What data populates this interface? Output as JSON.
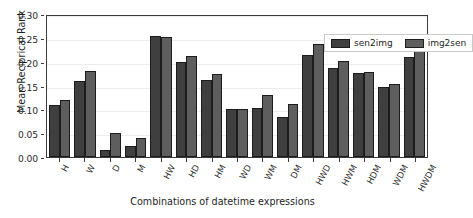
{
  "chart_data": {
    "type": "bar",
    "title": "",
    "xlabel": "Combinations of datetime expressions",
    "ylabel": "Mean Reciprical Rank",
    "categories": [
      "H",
      "W",
      "D",
      "M",
      "HW",
      "HD",
      "HM",
      "WD",
      "WM",
      "DM",
      "HWD",
      "HWM",
      "HDM",
      "WDM",
      "HWDM"
    ],
    "series": [
      {
        "name": "sen2img",
        "color": "#3f3f3f",
        "values": [
          0.109,
          0.159,
          0.015,
          0.024,
          0.254,
          0.2,
          0.161,
          0.101,
          0.102,
          0.083,
          0.215,
          0.187,
          0.177,
          0.146,
          0.209
        ]
      },
      {
        "name": "img2sen",
        "color": "#5e5e5e",
        "values": [
          0.12,
          0.18,
          0.05,
          0.04,
          0.251,
          0.212,
          0.174,
          0.101,
          0.13,
          0.112,
          0.238,
          0.201,
          0.179,
          0.153,
          0.228
        ]
      }
    ],
    "ylim": [
      0.0,
      0.3
    ],
    "yticks": [
      0.0,
      0.05,
      0.1,
      0.15,
      0.2,
      0.25,
      0.3
    ],
    "ytick_labels": [
      "0.00",
      "0.05",
      "0.10",
      "0.15",
      "0.20",
      "0.25",
      "0.30"
    ],
    "grid": true,
    "grid_axis": "y",
    "legend_position": "upper right",
    "legend_entries": [
      "sen2img",
      "img2sen"
    ]
  }
}
